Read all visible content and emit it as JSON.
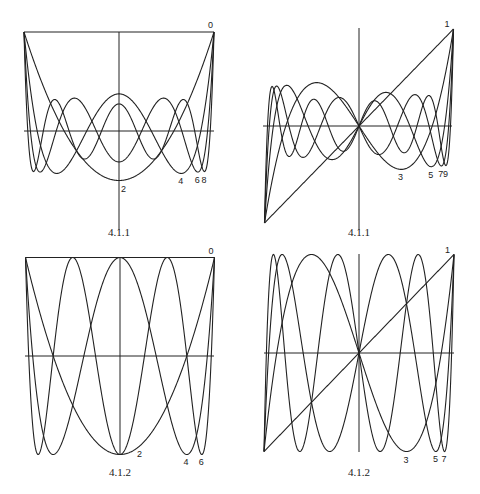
{
  "chart_data": [
    {
      "type": "line",
      "title": "Legendre polynomials P_n(x), even n",
      "caption": "4.1.1",
      "family": "legendre",
      "orders": [
        0,
        2,
        4,
        6,
        8
      ],
      "curve_labels": [
        "0",
        "2",
        "4",
        "6",
        "8"
      ],
      "xlim": [
        -1,
        1
      ],
      "ylim": [
        -0.5,
        1
      ],
      "grid": false,
      "frame": {
        "x0": 24,
        "x1": 214,
        "y_axis": 131,
        "unit_px": 99,
        "cx": 119,
        "vtop": 32,
        "vbottom": 230
      },
      "caption_pos": {
        "x": 119,
        "y": 226
      }
    },
    {
      "type": "line",
      "title": "Legendre polynomials P_n(x), odd n",
      "caption": "4.1.1",
      "family": "legendre",
      "orders": [
        1,
        3,
        5,
        7,
        9
      ],
      "curve_labels": [
        "1",
        "3",
        "5",
        "7",
        "9"
      ],
      "xlim": [
        -1,
        1
      ],
      "ylim": [
        -1,
        1
      ],
      "grid": false,
      "frame": {
        "x0": 263,
        "x1": 452,
        "y_axis": 126,
        "unit_px": 97,
        "cx": 359,
        "vtop": 28,
        "vbottom": 230
      },
      "caption_pos": {
        "x": 359,
        "y": 226
      }
    },
    {
      "type": "line",
      "title": "Chebyshev polynomials T_n(x), even n",
      "caption": "4.1.2",
      "family": "chebyshev",
      "orders": [
        0,
        2,
        4,
        6
      ],
      "curve_labels": [
        "0",
        "2",
        "4",
        "6"
      ],
      "xlim": [
        -1,
        1
      ],
      "ylim": [
        -1,
        1
      ],
      "grid": false,
      "frame": {
        "x0": 25,
        "x1": 214,
        "y_axis": 356,
        "unit_px": 98.5,
        "cx": 120,
        "vtop": 257,
        "vbottom": 455
      },
      "caption_pos": {
        "x": 120,
        "y": 466
      }
    },
    {
      "type": "line",
      "title": "Chebyshev polynomials T_n(x), odd n",
      "caption": "4.1.2",
      "family": "chebyshev",
      "orders": [
        1,
        3,
        5,
        7
      ],
      "curve_labels": [
        "1",
        "3",
        "5",
        "7"
      ],
      "xlim": [
        -1,
        1
      ],
      "ylim": [
        -1,
        1
      ],
      "grid": false,
      "frame": {
        "x0": 264,
        "x1": 454,
        "y_axis": 353,
        "unit_px": 98.5,
        "cx": 359,
        "vtop": 254,
        "vbottom": 452
      },
      "caption_pos": {
        "x": 359,
        "y": 466
      }
    }
  ]
}
